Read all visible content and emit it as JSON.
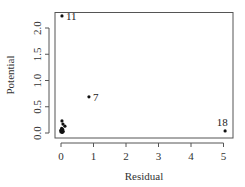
{
  "chart_data": {
    "type": "scatter",
    "title": "",
    "xlabel": "Residual",
    "ylabel": "Potential",
    "xlim": [
      -0.2,
      5.3
    ],
    "ylim": [
      -0.1,
      2.3
    ],
    "xticks": [
      0,
      1,
      2,
      3,
      4,
      5
    ],
    "xtick_labels": [
      "0",
      "1",
      "2",
      "3",
      "4",
      "5"
    ],
    "yticks": [
      0.0,
      0.5,
      1.0,
      1.5,
      2.0
    ],
    "ytick_labels": [
      "0.0",
      "0.5",
      "1.0",
      "1.5",
      "2.0"
    ],
    "grid": false,
    "legend": null,
    "points": [
      {
        "x": 0.03,
        "y": 2.23,
        "label": "11"
      },
      {
        "x": 0.86,
        "y": 0.69,
        "label": "7"
      },
      {
        "x": 5.05,
        "y": 0.04,
        "label": "18"
      },
      {
        "x": 0.03,
        "y": 0.23,
        "label": ""
      },
      {
        "x": 0.06,
        "y": 0.17,
        "label": ""
      },
      {
        "x": 0.12,
        "y": 0.13,
        "label": ""
      },
      {
        "x": 0.02,
        "y": 0.09,
        "label": ""
      },
      {
        "x": 0.05,
        "y": 0.07,
        "label": ""
      },
      {
        "x": -0.01,
        "y": 0.05,
        "label": ""
      },
      {
        "x": 0.03,
        "y": 0.04,
        "label": ""
      },
      {
        "x": 0.07,
        "y": 0.03,
        "label": ""
      },
      {
        "x": 0.0,
        "y": 0.02,
        "label": ""
      },
      {
        "x": 0.04,
        "y": 0.01,
        "label": ""
      }
    ]
  },
  "colors": {
    "points": "#111111",
    "axis": "#555555",
    "frame": "#555555"
  }
}
